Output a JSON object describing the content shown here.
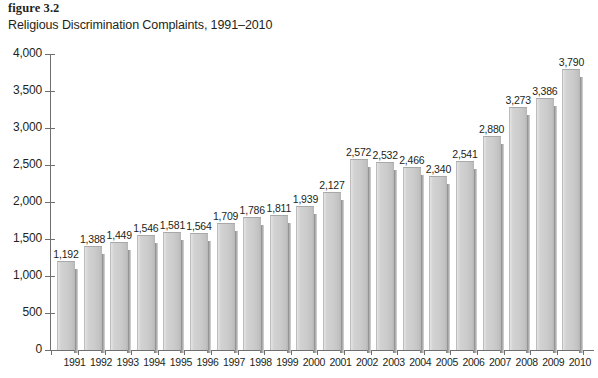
{
  "figure": {
    "label": "figure 3.2",
    "title": "Religious Discrimination Complaints, 1991–2010"
  },
  "chart_data": {
    "type": "bar",
    "title": "Religious Discrimination Complaints, 1991–2010",
    "xlabel": "",
    "ylabel": "",
    "ylim": [
      0,
      4000
    ],
    "ytick_step": 500,
    "ytick_labels": [
      "0",
      "500",
      "1,000",
      "1,500",
      "2,000",
      "2,500",
      "3,000",
      "3,500",
      "4,000"
    ],
    "ytick_values": [
      0,
      500,
      1000,
      1500,
      2000,
      2500,
      3000,
      3500,
      4000
    ],
    "grid": false,
    "legend": false,
    "bar_color": "#cccccc",
    "axis_color": "#6f6f6f",
    "text_color": "#231f20",
    "categories": [
      "1991",
      "1992",
      "1993",
      "1994",
      "1995",
      "1996",
      "1997",
      "1998",
      "1999",
      "2000",
      "2001",
      "2002",
      "2003",
      "2004",
      "2005",
      "2006",
      "2007",
      "2008",
      "2009",
      "2010"
    ],
    "values": [
      1192,
      1388,
      1449,
      1546,
      1581,
      1564,
      1709,
      1786,
      1811,
      1939,
      2127,
      2572,
      2532,
      2466,
      2340,
      2541,
      2880,
      3273,
      3386,
      3790
    ],
    "value_labels": [
      "1,192",
      "1,388",
      "1,449",
      "1,546",
      "1,581",
      "1,564",
      "1,709",
      "1,786",
      "1,811",
      "1,939",
      "2,127",
      "2,572",
      "2,532",
      "2,466",
      "2,340",
      "2,541",
      "2,880",
      "3,273",
      "3,386",
      "3,790"
    ]
  }
}
